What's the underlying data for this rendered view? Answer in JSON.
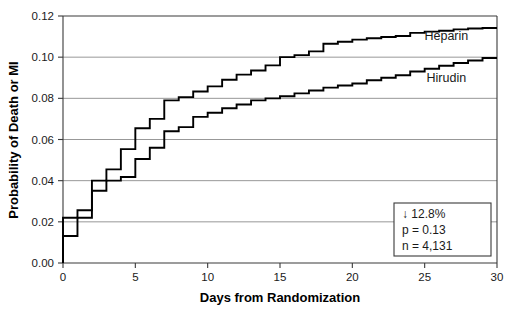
{
  "chart_data": {
    "type": "line",
    "subtype": "kaplan-meier-step",
    "title": "",
    "xlabel": "Days from Randomization",
    "ylabel": "Probability of Death or MI",
    "xlim": [
      0,
      30
    ],
    "ylim": [
      0.0,
      0.12
    ],
    "xticks": [
      0,
      5,
      10,
      15,
      20,
      25,
      30
    ],
    "xtick_labels": [
      "0",
      "5",
      "10",
      "15",
      "20",
      "25",
      "30"
    ],
    "yticks": [
      0.0,
      0.02,
      0.04,
      0.06,
      0.08,
      0.1,
      0.12
    ],
    "ytick_labels": [
      "0.00",
      "0.02",
      "0.04",
      "0.06",
      "0.08",
      "0.10",
      "0.12"
    ],
    "grid": "horizontal",
    "legend_position": "inline-right",
    "series": [
      {
        "name": "Heparin",
        "color": "#000000",
        "label_x": 26.5,
        "label_y": 0.1085,
        "x": [
          0,
          0,
          1,
          1,
          2,
          2,
          3,
          3,
          4,
          4,
          5,
          5,
          6,
          6,
          7,
          7,
          8,
          8,
          9,
          9,
          10,
          10,
          11,
          11,
          12,
          12,
          13,
          13,
          14,
          14,
          15,
          15,
          16,
          16,
          17,
          17,
          18,
          18,
          19,
          19,
          20,
          20,
          21,
          21,
          22,
          22,
          23,
          23,
          24,
          24,
          25,
          25,
          26,
          26,
          27,
          27,
          28,
          28,
          29,
          29,
          30
        ],
        "y": [
          0.0,
          0.022,
          0.022,
          0.0256,
          0.0256,
          0.04,
          0.04,
          0.0455,
          0.0455,
          0.0553,
          0.0553,
          0.0655,
          0.0655,
          0.07,
          0.07,
          0.079,
          0.079,
          0.0806,
          0.0806,
          0.0833,
          0.0833,
          0.0858,
          0.0858,
          0.089,
          0.089,
          0.0915,
          0.0915,
          0.0935,
          0.0935,
          0.096,
          0.096,
          0.1,
          0.1,
          0.101,
          0.101,
          0.1028,
          0.1028,
          0.1065,
          0.1065,
          0.1075,
          0.1075,
          0.1085,
          0.1085,
          0.1092,
          0.1092,
          0.1098,
          0.1098,
          0.1103,
          0.1103,
          0.1118,
          0.1118,
          0.1124,
          0.1124,
          0.1128,
          0.1128,
          0.1135,
          0.1135,
          0.1139,
          0.1139,
          0.1142,
          0.1142
        ],
        "final_value": 0.1142
      },
      {
        "name": "Hirudin",
        "color": "#000000",
        "label_x": 26.5,
        "label_y": 0.088,
        "x": [
          0,
          0,
          1,
          1,
          2,
          2,
          3,
          3,
          4,
          4,
          5,
          5,
          6,
          6,
          7,
          7,
          8,
          8,
          9,
          9,
          10,
          10,
          11,
          11,
          12,
          12,
          13,
          13,
          14,
          14,
          15,
          15,
          16,
          16,
          17,
          17,
          18,
          18,
          19,
          19,
          20,
          20,
          21,
          21,
          22,
          22,
          23,
          23,
          24,
          24,
          25,
          25,
          26,
          26,
          27,
          27,
          28,
          28,
          29,
          29,
          30
        ],
        "y": [
          0.0,
          0.0131,
          0.0131,
          0.022,
          0.022,
          0.0351,
          0.0351,
          0.04,
          0.04,
          0.0418,
          0.0418,
          0.0505,
          0.0505,
          0.056,
          0.056,
          0.064,
          0.064,
          0.066,
          0.066,
          0.071,
          0.071,
          0.073,
          0.073,
          0.0752,
          0.0752,
          0.077,
          0.077,
          0.079,
          0.079,
          0.08,
          0.08,
          0.081,
          0.081,
          0.0824,
          0.0824,
          0.0838,
          0.0838,
          0.0852,
          0.0852,
          0.0862,
          0.0862,
          0.0872,
          0.0872,
          0.0888,
          0.0888,
          0.09,
          0.09,
          0.0912,
          0.0912,
          0.093,
          0.093,
          0.0944,
          0.0944,
          0.0958,
          0.0958,
          0.0972,
          0.0972,
          0.0984,
          0.0984,
          0.0996,
          0.0996
        ],
        "final_value": 0.0996
      }
    ],
    "annotations": {
      "stats_box": {
        "lines": [
          "↓ 12.8%",
          "p = 0.13",
          "n = 4,131"
        ],
        "line1": "↓ 12.8%",
        "line2": "p = 0.13",
        "line3": "n = 4,131"
      }
    }
  },
  "colors": {
    "curve": "#000000",
    "grid": "#8c8c8c",
    "axis": "#3a3a3a",
    "background": "#ffffff",
    "text": "#1a1a1a"
  }
}
